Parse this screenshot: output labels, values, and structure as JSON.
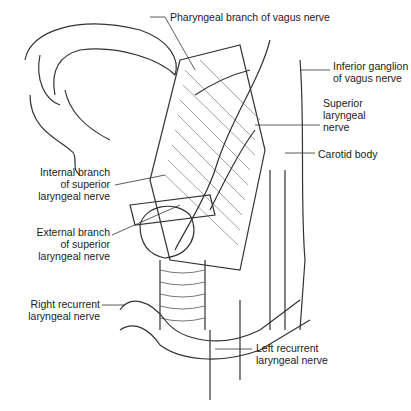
{
  "labels": {
    "pharyngeal": "Pharyngeal branch of vagus nerve",
    "inferior_ganglion": [
      "Inferior ganglion",
      "of vagus nerve"
    ],
    "superior_laryngeal": [
      "Superior",
      "laryngeal",
      "nerve"
    ],
    "carotid_body": "Carotid body",
    "internal_branch": [
      "Internal branch",
      "of superior",
      "laryngeal nerve"
    ],
    "external_branch": [
      "External branch",
      "of superior",
      "laryngeal nerve"
    ],
    "right_recurrent": [
      "Right recurrent",
      "laryngeal nerve"
    ],
    "left_recurrent": [
      "Left recurrent",
      "laryngeal nerve"
    ]
  }
}
